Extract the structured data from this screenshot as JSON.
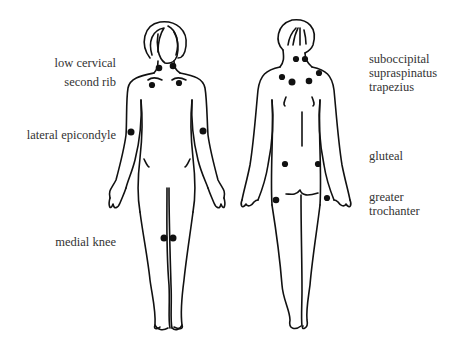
{
  "figure": {
    "colors": {
      "line": "#111111",
      "dot": "#111111",
      "text": "#333333",
      "background": "#ffffff"
    },
    "front_view": {
      "labels": [
        {
          "id": "low-cervical",
          "text": "low cervical"
        },
        {
          "id": "second-rib",
          "text": "second rib"
        },
        {
          "id": "lateral-epicondyle",
          "text": "lateral epicondyle"
        },
        {
          "id": "medial-knee",
          "text": "medial knee"
        }
      ]
    },
    "back_view": {
      "labels": [
        {
          "id": "suboccipital",
          "text": "suboccipital"
        },
        {
          "id": "supraspinatus",
          "text": "supraspinatus"
        },
        {
          "id": "trapezius",
          "text": "trapezius"
        },
        {
          "id": "gluteal",
          "text": "gluteal"
        },
        {
          "id": "greater-trochanter-1",
          "text": "greater"
        },
        {
          "id": "greater-trochanter-2",
          "text": "trochanter"
        }
      ]
    }
  }
}
